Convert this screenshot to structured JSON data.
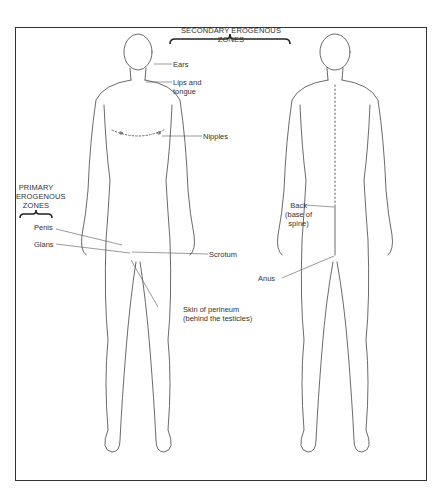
{
  "diagram": {
    "title_secondary": "SECONDARY EROGENOUS ZONES",
    "title_primary_lines": [
      "PRIMARY",
      "EROGENOUS",
      "ZONES"
    ],
    "figures": [
      "front-view",
      "back-view"
    ],
    "labels": {
      "ears": "Ears",
      "lips_1": "Lips and",
      "lips_2": "tongue",
      "nipples": "Nipples",
      "penis": "Penis",
      "glans": "Glans",
      "scrotum": "Scrotum",
      "perineum_1": "Skin of perineum",
      "perineum_2": "(behind the testicles)",
      "back_1": "Back",
      "back_2": "(base of",
      "back_3": "spine)",
      "anus": "Anus"
    },
    "colors": {
      "line": "#333333",
      "background": "#ffffff"
    }
  }
}
